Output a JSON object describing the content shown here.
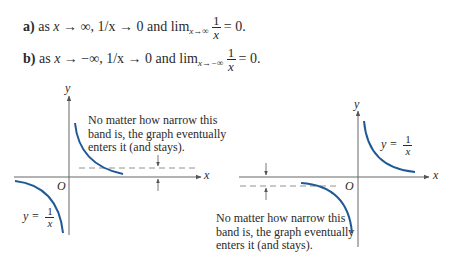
{
  "statements": [
    {
      "label": "a)",
      "text_pre": "as",
      "var": "x",
      "arrow": "→",
      "limit": "∞",
      "expr": "1/x → 0 and lim",
      "sub": "x→∞",
      "num": "1",
      "den": "x",
      "eq": "= 0."
    },
    {
      "label": "b)",
      "text_pre": "as",
      "var": "x",
      "arrow": "→",
      "limit": "−∞",
      "expr": "1/x → 0 and lim",
      "sub": "x→−∞",
      "num": "1",
      "den": "x",
      "eq": "= 0."
    }
  ],
  "figures": {
    "left": {
      "axis_x_label": "x",
      "axis_y_label": "y",
      "origin_label": "O",
      "function_label": {
        "lhs": "y =",
        "num": "1",
        "den": "x"
      },
      "note": [
        "No matter how narrow this",
        "band is, the graph eventually",
        "enters it (and stays)."
      ]
    },
    "right": {
      "axis_x_label": "x",
      "axis_y_label": "y",
      "origin_label": "O",
      "function_label": {
        "lhs": "y =",
        "num": "1",
        "den": "x"
      },
      "note": [
        "No matter how narrow this",
        "band is, the graph eventually",
        "enters it (and stays)."
      ]
    }
  },
  "colors": {
    "curve": "#1f5a96",
    "axis": "#555555",
    "text": "#2a2a2a"
  }
}
